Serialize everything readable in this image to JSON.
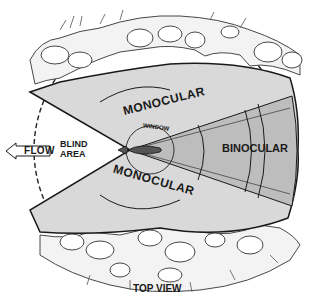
{
  "diagram": {
    "title": "TOP VIEW",
    "labels": {
      "flow": "FLOW",
      "blind_area_line1": "BLIND",
      "blind_area_line2": "AREA",
      "window": "WINDOW",
      "binocular": "BINOCULAR",
      "monocular_top": "MONOCULAR",
      "monocular_bottom": "MONOCULAR",
      "caption": "TOP VIEW"
    },
    "colors": {
      "field_of_view_fill": "#d9d9d9",
      "binocular_fill": "#bdbdbd",
      "outline": "#1a1a1a",
      "background": "#ffffff"
    },
    "regions": [
      "blind area",
      "monocular (upper)",
      "binocular",
      "monocular (lower)",
      "window"
    ]
  }
}
